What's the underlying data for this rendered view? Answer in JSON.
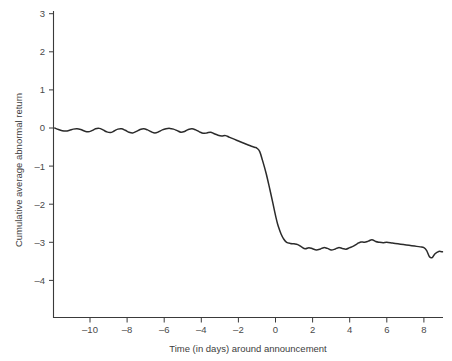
{
  "chart_data": {
    "type": "line",
    "title": "",
    "subtitle": "",
    "xlabel": "Time (in days) around announcement",
    "ylabel": "Cumulative average abnormal return",
    "xlim": [
      -12.2,
      9.1
    ],
    "ylim": [
      -4.6,
      3.2
    ],
    "xticks": [
      -10,
      -8,
      -6,
      -4,
      -2,
      0,
      2,
      4,
      6,
      8
    ],
    "xticklabels": [
      "-10",
      "-8",
      "-6",
      "-4",
      "-2",
      "0",
      "2",
      "4",
      "6",
      "8"
    ],
    "yticks": [
      3,
      2,
      1,
      0,
      -1,
      -2,
      -3,
      -4
    ],
    "yticklabels": [
      "3",
      "2",
      "1",
      "0",
      "-1",
      "-2",
      "-3",
      "-4"
    ],
    "grid": false,
    "legend": null,
    "legend_position": "none",
    "annotations": [],
    "series": [
      {
        "name": "Cumulative average abnormal return",
        "color": "#2b2b2b",
        "x": [
          -11.9,
          -11.7,
          -11.5,
          -11.3,
          -11.1,
          -10.9,
          -10.7,
          -10.5,
          -10.3,
          -10.1,
          -9.9,
          -9.7,
          -9.5,
          -9.3,
          -9.1,
          -8.9,
          -8.7,
          -8.5,
          -8.3,
          -8.1,
          -7.9,
          -7.7,
          -7.5,
          -7.3,
          -7.1,
          -6.9,
          -6.7,
          -6.5,
          -6.3,
          -6.1,
          -5.9,
          -5.7,
          -5.5,
          -5.3,
          -5.1,
          -4.9,
          -4.7,
          -4.5,
          -4.3,
          -4.1,
          -3.9,
          -3.7,
          -3.5,
          -3.3,
          -3.1,
          -2.9,
          -2.7,
          -2.5,
          -2.3,
          -2.1,
          -1.9,
          -1.7,
          -1.5,
          -1.3,
          -1.1,
          -1.0,
          -0.85,
          -0.7,
          -0.5,
          -0.3,
          -0.15,
          -0.05,
          0.05,
          0.15,
          0.3,
          0.45,
          0.6,
          0.8,
          1.0,
          1.2,
          1.4,
          1.6,
          1.8,
          2.0,
          2.2,
          2.4,
          2.6,
          2.8,
          3.0,
          3.2,
          3.4,
          3.6,
          3.8,
          4.0,
          4.2,
          4.4,
          4.6,
          4.8,
          5.0,
          5.2,
          5.4,
          5.6,
          5.8,
          6.0,
          6.3,
          6.6,
          6.9,
          7.2,
          7.5,
          7.8,
          8.0,
          8.15,
          8.3,
          8.45,
          8.6,
          8.8,
          9.0
        ],
        "y": [
          0.0,
          -0.04,
          -0.07,
          -0.08,
          -0.06,
          -0.03,
          -0.02,
          -0.04,
          -0.08,
          -0.1,
          -0.07,
          -0.02,
          -0.01,
          -0.05,
          -0.1,
          -0.12,
          -0.08,
          -0.03,
          -0.02,
          -0.06,
          -0.11,
          -0.13,
          -0.09,
          -0.04,
          -0.02,
          -0.05,
          -0.1,
          -0.13,
          -0.1,
          -0.05,
          -0.02,
          -0.01,
          -0.03,
          -0.07,
          -0.11,
          -0.09,
          -0.04,
          -0.02,
          -0.05,
          -0.1,
          -0.14,
          -0.13,
          -0.11,
          -0.15,
          -0.19,
          -0.21,
          -0.2,
          -0.24,
          -0.28,
          -0.32,
          -0.36,
          -0.4,
          -0.44,
          -0.48,
          -0.51,
          -0.53,
          -0.62,
          -0.85,
          -1.2,
          -1.62,
          -1.95,
          -2.18,
          -2.4,
          -2.58,
          -2.78,
          -2.92,
          -3.0,
          -3.03,
          -3.04,
          -3.06,
          -3.12,
          -3.17,
          -3.14,
          -3.17,
          -3.2,
          -3.18,
          -3.14,
          -3.16,
          -3.2,
          -3.18,
          -3.14,
          -3.16,
          -3.18,
          -3.14,
          -3.1,
          -3.04,
          -2.99,
          -3.0,
          -2.97,
          -2.93,
          -2.98,
          -3.0,
          -3.01,
          -3.0,
          -3.02,
          -3.04,
          -3.06,
          -3.08,
          -3.1,
          -3.12,
          -3.14,
          -3.22,
          -3.38,
          -3.4,
          -3.3,
          -3.24,
          -3.25
        ]
      }
    ]
  },
  "axes": {
    "x_title": "Time (in days) around announcement",
    "y_title": "Cumulative average abnormal return"
  }
}
